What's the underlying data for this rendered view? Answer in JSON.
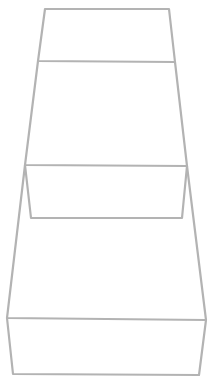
{
  "canvas": {
    "width": 212,
    "height": 381,
    "background": "#ffffff"
  },
  "style": {
    "stroke": "#b3b3b3",
    "stroke_width": 2.2
  },
  "shapes": [
    {
      "name": "top-box",
      "polylines": [
        [
          [
            45,
            9
          ],
          [
            169,
            9
          ],
          [
            175,
            62
          ],
          [
            38,
            61
          ],
          [
            45,
            9
          ]
        ]
      ]
    },
    {
      "name": "middle-box",
      "polylines": [
        [
          [
            38,
            61
          ],
          [
            25,
            165
          ],
          [
            187,
            166
          ],
          [
            175,
            62
          ]
        ],
        [
          [
            25,
            165
          ],
          [
            31,
            218
          ],
          [
            182,
            218
          ],
          [
            187,
            166
          ]
        ]
      ]
    },
    {
      "name": "bottom-box",
      "polylines": [
        [
          [
            25,
            165
          ],
          [
            7,
            318
          ],
          [
            206,
            320
          ],
          [
            187,
            166
          ]
        ],
        [
          [
            7,
            318
          ],
          [
            13,
            374
          ],
          [
            199,
            375
          ],
          [
            206,
            320
          ]
        ]
      ]
    }
  ]
}
